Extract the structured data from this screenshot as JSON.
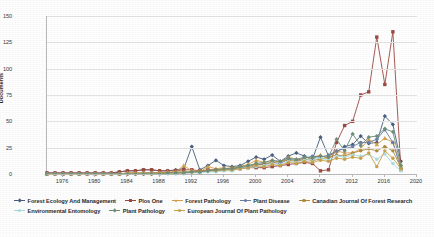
{
  "chart_data": {
    "type": "line",
    "title": "",
    "xlabel": "",
    "ylabel": "Documents",
    "xlim": [
      1974,
      2020
    ],
    "ylim": [
      0,
      150
    ],
    "yticks": [
      0,
      25,
      50,
      75,
      100,
      125,
      150
    ],
    "xticks": [
      1976,
      1980,
      1984,
      1988,
      1992,
      1996,
      2000,
      2004,
      2008,
      2012,
      2016,
      2020
    ],
    "grid": true,
    "legend_position": "bottom",
    "x": [
      1974,
      1975,
      1976,
      1977,
      1978,
      1979,
      1980,
      1981,
      1982,
      1983,
      1984,
      1985,
      1986,
      1987,
      1988,
      1989,
      1990,
      1991,
      1992,
      1993,
      1994,
      1995,
      1996,
      1997,
      1998,
      1999,
      2000,
      2001,
      2002,
      2003,
      2004,
      2005,
      2006,
      2007,
      2008,
      2009,
      2010,
      2011,
      2012,
      2013,
      2014,
      2015,
      2016,
      2017,
      2018
    ],
    "series": [
      {
        "name": "Forest Ecology And Management",
        "color": "#4a5f80",
        "marker": "diamond",
        "values": [
          1,
          1,
          1,
          1,
          1,
          1,
          1,
          1,
          1,
          2,
          3,
          3,
          4,
          4,
          3,
          3,
          4,
          5,
          26,
          4,
          8,
          13,
          8,
          7,
          8,
          12,
          16,
          14,
          18,
          12,
          17,
          20,
          17,
          14,
          35,
          17,
          21,
          26,
          28,
          36,
          29,
          30,
          55,
          47,
          12
        ]
      },
      {
        "name": "Plos One",
        "color": "#9c4b43",
        "marker": "square",
        "values": [
          1,
          1,
          1,
          1,
          1,
          1,
          1,
          1,
          1,
          2,
          3,
          3,
          4,
          4,
          3,
          3,
          3,
          4,
          4,
          3,
          4,
          4,
          4,
          4,
          5,
          6,
          6,
          6,
          7,
          8,
          9,
          10,
          11,
          10,
          3,
          4,
          30,
          46,
          50,
          75,
          78,
          130,
          85,
          135,
          4
        ]
      },
      {
        "name": "Forest Pathology",
        "color": "#d8a04a",
        "marker": "triangle",
        "values": [
          0,
          0,
          0,
          0,
          0,
          0,
          0,
          0,
          0,
          0,
          1,
          1,
          1,
          1,
          1,
          2,
          2,
          8,
          3,
          2,
          7,
          5,
          6,
          4,
          7,
          9,
          13,
          11,
          13,
          11,
          16,
          14,
          13,
          16,
          18,
          14,
          22,
          20,
          20,
          24,
          33,
          28,
          34,
          30,
          9
        ]
      },
      {
        "name": "Plant Disease",
        "color": "#6b7fa8",
        "marker": "circle",
        "values": [
          0,
          0,
          0,
          0,
          0,
          0,
          0,
          0,
          0,
          0,
          0,
          0,
          1,
          1,
          1,
          1,
          1,
          2,
          2,
          2,
          3,
          3,
          4,
          5,
          6,
          7,
          9,
          9,
          11,
          10,
          14,
          13,
          15,
          17,
          16,
          18,
          22,
          24,
          26,
          30,
          30,
          33,
          42,
          30,
          5
        ]
      },
      {
        "name": "Canadian Journal Of Forest Research",
        "color": "#b08a3c",
        "marker": "circle",
        "values": [
          0,
          0,
          0,
          0,
          0,
          0,
          0,
          0,
          0,
          0,
          1,
          1,
          1,
          1,
          1,
          1,
          2,
          2,
          2,
          3,
          3,
          4,
          5,
          6,
          7,
          8,
          9,
          10,
          11,
          12,
          13,
          12,
          14,
          13,
          14,
          16,
          18,
          17,
          20,
          22,
          24,
          22,
          26,
          22,
          6
        ]
      },
      {
        "name": "Environmental Entomology",
        "color": "#aadde0",
        "marker": "circle",
        "values": [
          0,
          0,
          0,
          0,
          0,
          0,
          0,
          0,
          0,
          0,
          0,
          0,
          0,
          0,
          0,
          0,
          0,
          0,
          1,
          1,
          2,
          2,
          3,
          3,
          5,
          6,
          7,
          8,
          10,
          9,
          12,
          11,
          13,
          14,
          15,
          13,
          17,
          16,
          18,
          17,
          19,
          14,
          19,
          10,
          3
        ]
      },
      {
        "name": "European Journal Of Plant Pathology",
        "color": "#c9a24a",
        "marker": "circle",
        "values": [
          0,
          0,
          0,
          0,
          0,
          0,
          0,
          0,
          0,
          0,
          0,
          0,
          0,
          0,
          1,
          1,
          1,
          1,
          2,
          2,
          3,
          3,
          4,
          4,
          5,
          6,
          8,
          7,
          9,
          8,
          11,
          10,
          12,
          11,
          13,
          12,
          15,
          14,
          16,
          15,
          20,
          7,
          22,
          15,
          5
        ]
      },
      {
        "name": "Plant Pathology",
        "color": "#6f8f7a",
        "marker": "diamond",
        "values": [
          0,
          0,
          0,
          0,
          0,
          0,
          0,
          0,
          0,
          0,
          0,
          0,
          0,
          0,
          0,
          1,
          1,
          1,
          2,
          2,
          3,
          4,
          5,
          5,
          7,
          8,
          10,
          11,
          13,
          12,
          15,
          14,
          16,
          15,
          17,
          16,
          33,
          22,
          38,
          27,
          35,
          36,
          43,
          40,
          8
        ]
      }
    ]
  },
  "axis": {
    "y_label": "Documents",
    "y_tick_labels": [
      "0",
      "25",
      "50",
      "75",
      "100",
      "125",
      "150"
    ],
    "x_tick_labels": [
      "1976",
      "1980",
      "1984",
      "1988",
      "1992",
      "1996",
      "2000",
      "2004",
      "2008",
      "2012",
      "2016",
      "2020"
    ]
  },
  "legend": {
    "items": [
      {
        "label": "Forest Ecology And Management",
        "color": "#4a5f80",
        "marker": "diamond-marker"
      },
      {
        "label": "Plos One",
        "color": "#9c4b43",
        "marker": "square-marker"
      },
      {
        "label": "Forest Pathology",
        "color": "#d8a04a",
        "marker": "triangle-marker"
      },
      {
        "label": "Plant Disease",
        "color": "#6b7fa8",
        "marker": "circle-marker"
      },
      {
        "label": "Canadian Journal Of Forest Research",
        "color": "#b08a3c",
        "marker": "circle-marker"
      },
      {
        "label": "Environmental Entomology",
        "color": "#aadde0",
        "marker": "circle-marker"
      },
      {
        "label": "Plant Pathology",
        "color": "#6f8f7a",
        "marker": "diamond-marker"
      },
      {
        "label": "European Journal Of Plant Pathology",
        "color": "#c9a24a",
        "marker": "circle-marker"
      }
    ]
  }
}
